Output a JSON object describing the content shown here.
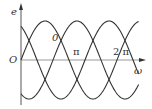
{
  "chart_data": {
    "type": "line",
    "title": "",
    "xlabel": "ω",
    "ylabel": "e",
    "origin_label": "O",
    "x_ticks": [
      "π",
      "2 π"
    ],
    "annotation": "0",
    "series": [
      {
        "name": "e1",
        "phase_deg": 0
      },
      {
        "name": "e2",
        "phase_deg": -120
      },
      {
        "name": "e3",
        "phase_deg": 120
      }
    ],
    "amplitude": 1,
    "x_range": [
      "0",
      "2π+"
    ],
    "grid": false
  },
  "labels": {
    "y_axis": "e",
    "x_axis": "ω",
    "origin": "O",
    "pi": "π",
    "two_pi": "2 π",
    "zero": "0"
  }
}
